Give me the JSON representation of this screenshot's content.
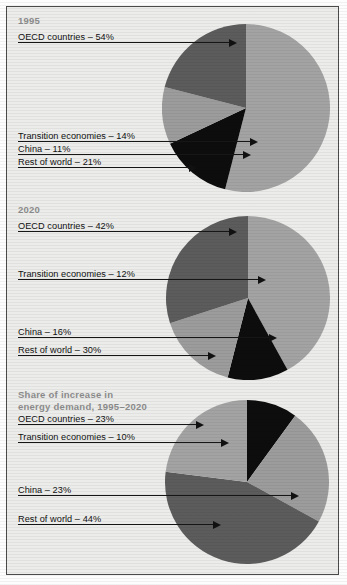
{
  "figure": {
    "background_color": "#ececea",
    "border_color": "#4a4a4a"
  },
  "palette": {
    "oecd": "#a3a3a3",
    "transition": "#0d0d0d",
    "china": "#9c9c9c",
    "rest_of_world": "#5c5c5c",
    "text": "#111111",
    "title": "#8d8d8d",
    "leader": "#161616"
  },
  "charts": [
    {
      "id": "pie-1995",
      "title": "1995",
      "labels": [
        {
          "name": "OECD countries",
          "text": "OECD countries – 54%"
        },
        {
          "name": "Transition economies",
          "text": "Transition economies – 14%"
        },
        {
          "name": "China",
          "text": "China – 11%"
        },
        {
          "name": "Rest of world",
          "text": "Rest of world – 21%"
        }
      ]
    },
    {
      "id": "pie-2020",
      "title": "2020",
      "labels": [
        {
          "name": "OECD countries",
          "text": "OECD countries – 42%"
        },
        {
          "name": "Transition economies",
          "text": "Transition economies – 12%"
        },
        {
          "name": "China",
          "text": "China – 16%"
        },
        {
          "name": "Rest of world",
          "text": "Rest of world – 30%"
        }
      ]
    },
    {
      "id": "pie-share-of-increase",
      "title": "Share of increase in\nenergy demand, 1995–2020",
      "labels": [
        {
          "name": "OECD countries",
          "text": "OECD countries – 23%"
        },
        {
          "name": "Transition economies",
          "text": "Transition economies – 10%"
        },
        {
          "name": "China",
          "text": "China – 23%"
        },
        {
          "name": "Rest of world",
          "text": "Rest of world – 44%"
        }
      ]
    }
  ],
  "chart_data": [
    {
      "type": "pie",
      "title": "1995",
      "categories": [
        "OECD countries",
        "Transition economies",
        "China",
        "Rest of world"
      ],
      "values": [
        54,
        14,
        11,
        21
      ],
      "unit": "%",
      "colors": [
        "#a3a3a3",
        "#0d0d0d",
        "#9c9c9c",
        "#5c5c5c"
      ],
      "start_angle_deg": -90,
      "direction": "clockwise",
      "legend": "leader-lines-left",
      "grid": false
    },
    {
      "type": "pie",
      "title": "2020",
      "categories": [
        "OECD countries",
        "Transition economies",
        "China",
        "Rest of world"
      ],
      "values": [
        42,
        12,
        16,
        30
      ],
      "unit": "%",
      "colors": [
        "#a3a3a3",
        "#0d0d0d",
        "#9c9c9c",
        "#5c5c5c"
      ],
      "start_angle_deg": -90,
      "direction": "clockwise",
      "legend": "leader-lines-left",
      "grid": false
    },
    {
      "type": "pie",
      "title": "Share of increase in energy demand, 1995–2020",
      "categories": [
        "OECD countries",
        "Transition economies",
        "China",
        "Rest of world"
      ],
      "values": [
        23,
        10,
        23,
        44
      ],
      "unit": "%",
      "colors": [
        "#a3a3a3",
        "#0d0d0d",
        "#9c9c9c",
        "#5c5c5c"
      ],
      "start_angle_deg": -90,
      "direction": "clockwise",
      "legend": "leader-lines-left",
      "grid": false
    }
  ]
}
